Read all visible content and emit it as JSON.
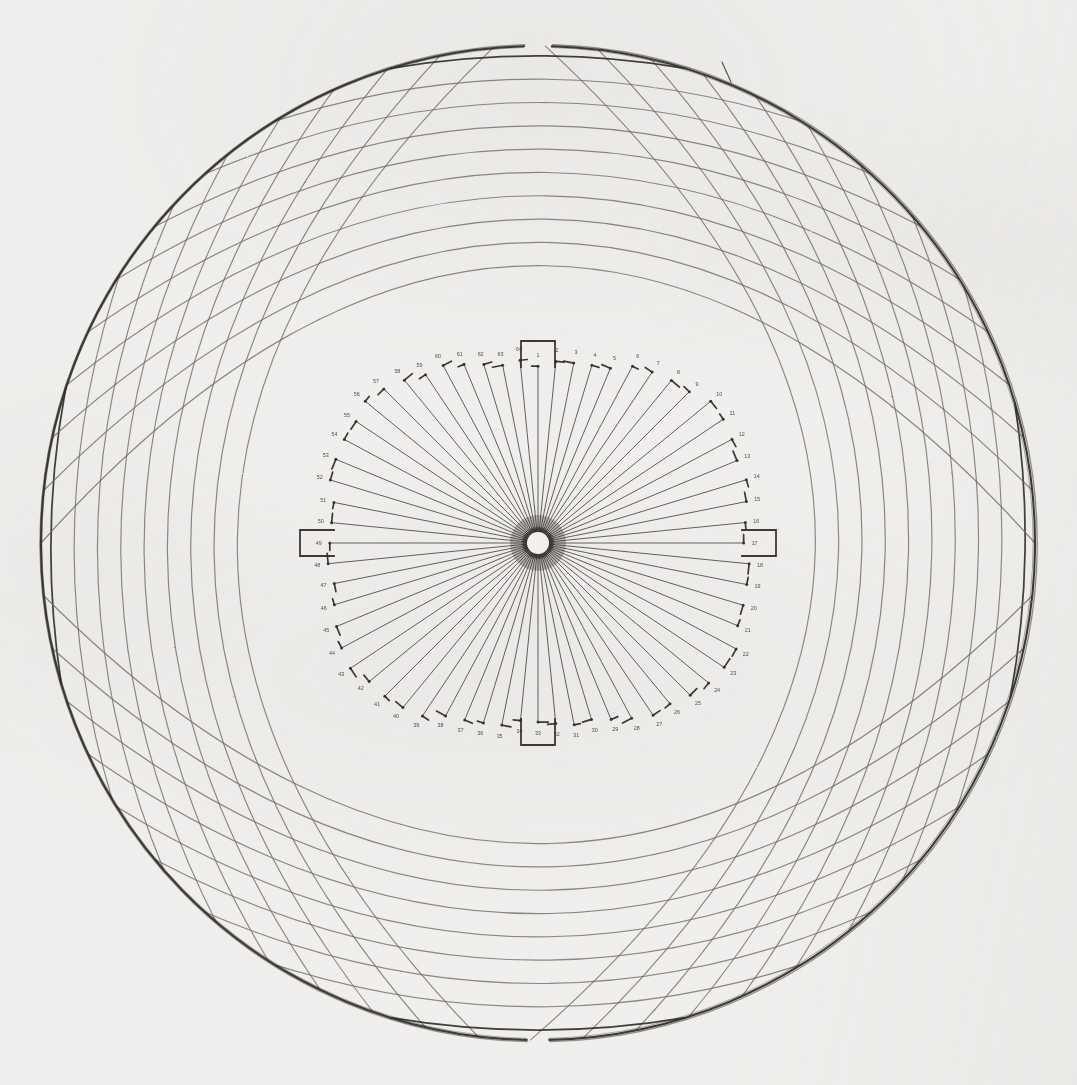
{
  "document": {
    "kind": "scanned-technical-plate",
    "title": "Spherical projection net with radial spoke diagram",
    "medium": "monochrome halftone scan on aged paper",
    "background_color": "#f2f1ef",
    "ink_color": "#2e2b28",
    "faint_ink_color": "#6e6a66"
  },
  "plate": {
    "canvas_width": 1077,
    "canvas_height": 1085,
    "outer_circle": {
      "center_x": 538,
      "center_y": 543,
      "radius": 497,
      "stroke_width": 2.0,
      "gap_top_degrees": 3.2,
      "gap_bottom_degrees": 2.6
    },
    "mesh": {
      "description": "two opposing families of circular arcs crossing at near right angles, forming a curvilinear quadrilateral net",
      "family_a_count": 19,
      "family_b_count": 19,
      "arc_bulge": 0.62,
      "stroke_width": 1.15
    },
    "spokes": {
      "count": 64,
      "hub_radius": 11,
      "inner_start_radius": 3,
      "tick_length": 9,
      "stroke_width": 0.85,
      "ring_shape": "rounded-square, wider horizontally than vertically",
      "ring_radius_horizontal": 208,
      "ring_radius_vertical": 180
    },
    "brackets": {
      "count": 4,
      "positions": [
        "top",
        "right",
        "bottom",
        "left"
      ],
      "width": 34,
      "height": 26,
      "stroke_width": 1.8
    },
    "labels": {
      "note": "each spoke terminates in a tiny 2-3 digit numeral, rendered at scan resolution and largely illegible",
      "font_size": 5.4,
      "values": [
        "1",
        "2",
        "3",
        "4",
        "5",
        "6",
        "7",
        "8",
        "9",
        "10",
        "11",
        "12",
        "13",
        "14",
        "15",
        "16",
        "17",
        "18",
        "19",
        "20",
        "21",
        "22",
        "23",
        "24",
        "25",
        "26",
        "27",
        "28",
        "29",
        "30",
        "31",
        "32",
        "33",
        "34",
        "35",
        "36",
        "37",
        "38",
        "39",
        "40",
        "41",
        "42",
        "43",
        "44",
        "45",
        "46",
        "47",
        "48",
        "49",
        "50",
        "51",
        "52",
        "53",
        "54",
        "55",
        "56",
        "57",
        "58",
        "59",
        "60",
        "61",
        "62",
        "63",
        "64"
      ]
    },
    "stray_mark": {
      "present": true,
      "location": "upper right rim",
      "x1": 722,
      "y1": 62,
      "x2": 731,
      "y2": 82
    }
  }
}
